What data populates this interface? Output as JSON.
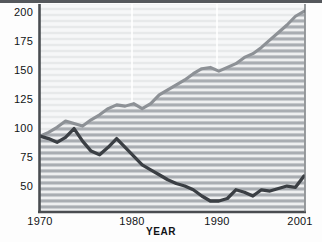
{
  "chart_data": {
    "type": "line",
    "title": "",
    "xlabel": "YEAR",
    "ylabel": "",
    "xlim": [
      1970,
      2001
    ],
    "ylim": [
      40,
      205
    ],
    "grid": "horizontal-striped-fill-and-vertical-decade-lines",
    "legend": "inline-annotations",
    "yticks": [
      50,
      75,
      100,
      125,
      150,
      175,
      200
    ],
    "xticks": [
      1970,
      1980,
      1990,
      2001
    ],
    "x": [
      1970,
      1971,
      1972,
      1973,
      1974,
      1975,
      1976,
      1977,
      1978,
      1979,
      1980,
      1981,
      1982,
      1983,
      1984,
      1985,
      1986,
      1987,
      1988,
      1989,
      1990,
      1991,
      1992,
      1993,
      1994,
      1995,
      1996,
      1997,
      1998,
      1999,
      2000,
      2001
    ],
    "series": [
      {
        "name": "Real GDP per capita",
        "color": "#8d9196",
        "fill": "striped-gray",
        "values": [
          100,
          103,
          107,
          112,
          110,
          108,
          113,
          117,
          122,
          125,
          124,
          126,
          122,
          126,
          133,
          137,
          141,
          145,
          150,
          154,
          155,
          152,
          155,
          158,
          163,
          166,
          171,
          177,
          183,
          189,
          196,
          200
        ]
      },
      {
        "name": "Social health",
        "color": "#3b3f44",
        "fill": "none",
        "values": [
          100,
          98,
          95,
          99,
          106,
          96,
          88,
          85,
          91,
          98,
          91,
          84,
          77,
          73,
          69,
          65,
          62,
          60,
          57,
          52,
          48,
          48,
          50,
          57,
          55,
          52,
          57,
          56,
          58,
          60,
          59,
          68
        ]
      }
    ],
    "annotations": [
      {
        "name": "Real GDP per capita",
        "line1": "Real GDP",
        "line2": "per capita"
      },
      {
        "name": "Social health",
        "line1": "Social health",
        "line2": ""
      }
    ]
  },
  "axes": {
    "y_labels": [
      "200",
      "175",
      "150",
      "125",
      "100",
      "75",
      "50"
    ],
    "x_labels": [
      "1970",
      "1980",
      "1990",
      "2001"
    ],
    "x_title": "YEAR"
  },
  "labels": {
    "gdp_line1": "Real GDP",
    "gdp_line2": "per capita",
    "social_health": "Social health"
  },
  "colors": {
    "gdp_line": "#8d9196",
    "social_line": "#3b3f44",
    "axis": "#4a4d51",
    "plot_bg": "#f2f3f4",
    "stripe": "#a9adb2",
    "text": "#111315"
  }
}
